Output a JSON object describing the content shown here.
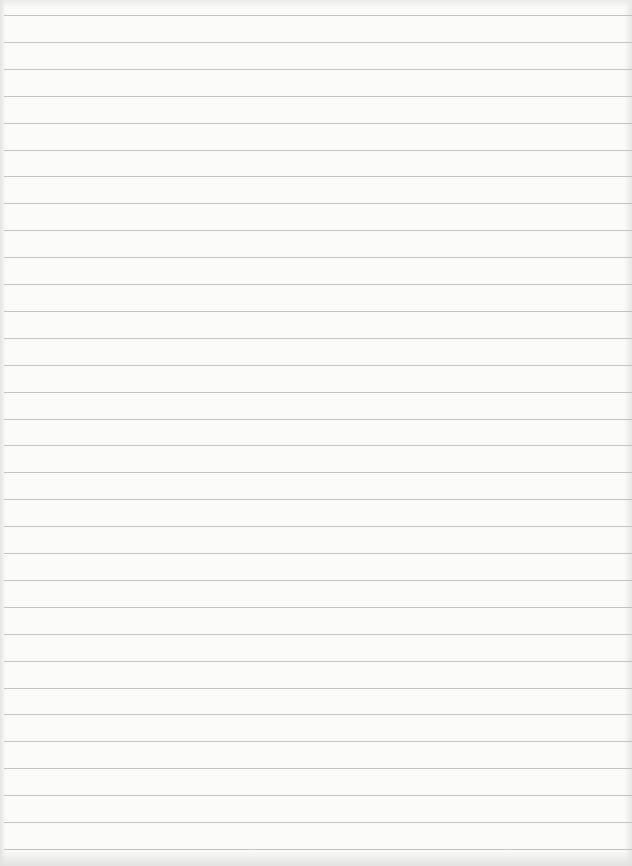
{
  "page": {
    "type": "lined-paper",
    "background_color": "#fbfbfa",
    "line_color": "#b9bab8",
    "first_line_y": 15,
    "line_spacing_px": 26.9,
    "line_count": 32,
    "text": ""
  }
}
